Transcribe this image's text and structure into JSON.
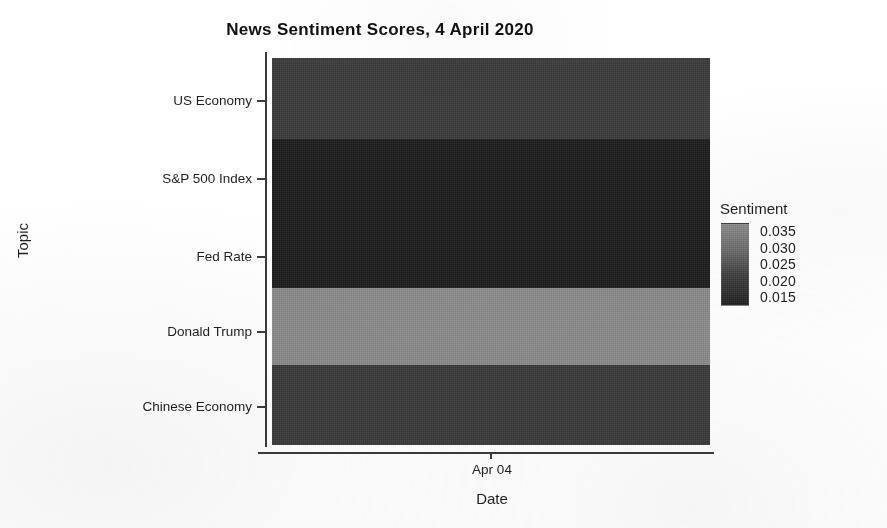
{
  "chart_data": {
    "type": "heatmap",
    "title": "News Sentiment Scores, 4 April 2020",
    "xlabel": "Date",
    "ylabel": "Topic",
    "x_categories": [
      "Apr 04"
    ],
    "x_tick_labels": [
      "Apr 04"
    ],
    "y_categories": [
      "US Economy",
      "S&P 500 Index",
      "Fed Rate",
      "Donald Trump",
      "Chinese Economy"
    ],
    "legend": {
      "title": "Sentiment",
      "tick_labels": [
        "0.035",
        "0.030",
        "0.025",
        "0.020",
        "0.015"
      ],
      "tick_values": [
        0.035,
        0.03,
        0.025,
        0.02,
        0.015
      ],
      "vmin": 0.012,
      "vmax": 0.037,
      "position": "right",
      "orientation": "vertical",
      "gradient_top_color": "#8f8f8f",
      "gradient_bottom_color": "#1e1e1e"
    },
    "grid": false,
    "cells": [
      {
        "topic": "US Economy",
        "date": "Apr 04",
        "value": 0.023,
        "color": "#3a3a3a"
      },
      {
        "topic": "S&P 500 Index",
        "date": "Apr 04",
        "value": 0.013,
        "color": "#1c1c1c"
      },
      {
        "topic": "Fed Rate",
        "date": "Apr 04",
        "value": 0.013,
        "color": "#1c1c1c"
      },
      {
        "topic": "Donald Trump",
        "date": "Apr 04",
        "value": 0.035,
        "color": "#8c8c8c"
      },
      {
        "topic": "Chinese Economy",
        "date": "Apr 04",
        "value": 0.023,
        "color": "#3a3a3a"
      }
    ],
    "rows_layout": [
      {
        "topic": "US Economy",
        "top": 0,
        "height": 81,
        "tick_y": 42,
        "color": "#3a3a3a"
      },
      {
        "topic": "S&P 500 Index",
        "top": 81,
        "height": 75,
        "tick_y": 120,
        "color": "#1c1c1c"
      },
      {
        "topic": "Fed Rate",
        "top": 156,
        "height": 74,
        "tick_y": 198,
        "color": "#1c1c1c"
      },
      {
        "topic": "Donald Trump",
        "top": 230,
        "height": 77,
        "tick_y": 273,
        "color": "#8c8c8c"
      },
      {
        "topic": "Chinese Economy",
        "top": 307,
        "height": 80,
        "tick_y": 348,
        "color": "#3a3a3a"
      }
    ]
  },
  "colors": {
    "axis": "#3b3b3b",
    "text": "#1f1f1f",
    "background": "#ffffff"
  }
}
